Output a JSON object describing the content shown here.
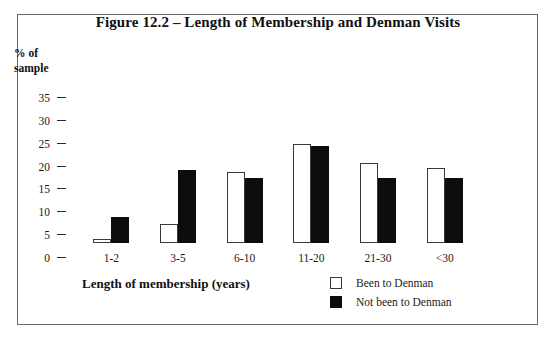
{
  "figure": {
    "title": "Figure 12.2 – Length of Membership and Denman Visits",
    "border_color": "#6a6a6a"
  },
  "axes": {
    "y_title": "% of\nsample",
    "y_ticks": [
      "35",
      "30",
      "25",
      "20",
      "15",
      "10",
      "5",
      "0"
    ],
    "x_title": "Length of membership (years)"
  },
  "legend": {
    "items": [
      {
        "label": "Been to Denman",
        "swatch": "white-square-icon",
        "color": "#ffffff"
      },
      {
        "label": "Not been to Denman",
        "swatch": "black-square-icon",
        "color": "#0d0d0d"
      }
    ]
  },
  "chart_data": {
    "type": "bar",
    "title": "Figure 12.2 – Length of Membership and Denman Visits",
    "xlabel": "Length of membership (years)",
    "ylabel": "% of sample",
    "categories": [
      "1-2",
      "3-5",
      "6-10",
      "11-20",
      "21-30",
      "<30"
    ],
    "series": [
      {
        "name": "Been to Denman",
        "color": "#ffffff",
        "values": [
          1,
          5,
          19,
          26.5,
          21.5,
          20
        ]
      },
      {
        "name": "Not been to Denman",
        "color": "#0d0d0d",
        "values": [
          7,
          19.5,
          17.5,
          26,
          17.5,
          17.5
        ]
      }
    ],
    "ylim": [
      0,
      35
    ],
    "ytick_step": 5,
    "grid": false,
    "legend_position": "bottom-right"
  }
}
